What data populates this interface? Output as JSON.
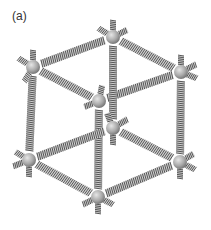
{
  "figure": {
    "label": "(a)",
    "colors": {
      "sphere": "#a8a8a8",
      "spring": "#555555",
      "background": "#ffffff"
    },
    "nodes": [
      {
        "id": "top-left",
        "x": 33,
        "y": 67
      },
      {
        "id": "top-back",
        "x": 113,
        "y": 37
      },
      {
        "id": "top-front",
        "x": 99,
        "y": 101
      },
      {
        "id": "top-right",
        "x": 181,
        "y": 72
      },
      {
        "id": "bottom-back",
        "x": 113,
        "y": 128
      },
      {
        "id": "bottom-left",
        "x": 29,
        "y": 160
      },
      {
        "id": "bottom-right",
        "x": 180,
        "y": 162
      },
      {
        "id": "bottom-front",
        "x": 98,
        "y": 197
      }
    ],
    "edges": [
      [
        "top-left",
        "top-back"
      ],
      [
        "top-back",
        "top-right"
      ],
      [
        "top-left",
        "top-front"
      ],
      [
        "top-front",
        "top-right"
      ],
      [
        "top-left",
        "bottom-left"
      ],
      [
        "top-back",
        "bottom-back"
      ],
      [
        "top-front",
        "bottom-front"
      ],
      [
        "top-right",
        "bottom-right"
      ],
      [
        "bottom-left",
        "bottom-back"
      ],
      [
        "bottom-back",
        "bottom-right"
      ],
      [
        "bottom-left",
        "bottom-front"
      ],
      [
        "bottom-front",
        "bottom-right"
      ]
    ]
  }
}
